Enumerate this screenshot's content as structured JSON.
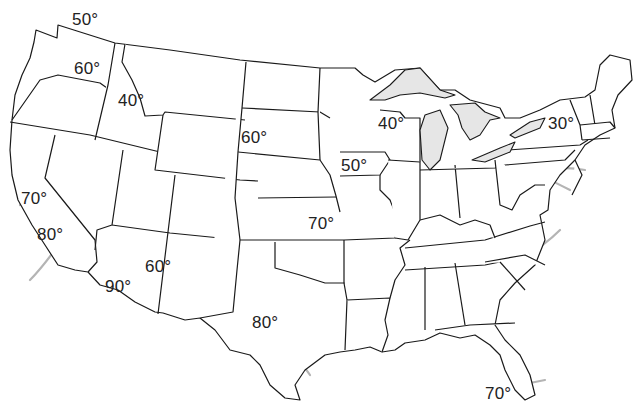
{
  "map": {
    "title": "",
    "subject": "United States isotherm map",
    "style": {
      "state_border_color": "#1a1a1a",
      "isotherm_color": "#b4b4b4",
      "lake_fill": "#e6e6e6",
      "background": "#ffffff",
      "label_color": "#222222"
    },
    "labels": [
      {
        "id": "wa-north",
        "text": "50°",
        "x": 72,
        "y": 11
      },
      {
        "id": "washington",
        "text": "60°",
        "x": 74,
        "y": 60
      },
      {
        "id": "idaho",
        "text": "40°",
        "x": 118,
        "y": 92
      },
      {
        "id": "south-dakota",
        "text": "60°",
        "x": 241,
        "y": 129
      },
      {
        "id": "wisconsin",
        "text": "40°",
        "x": 378,
        "y": 115
      },
      {
        "id": "new-york",
        "text": "30°",
        "x": 548,
        "y": 115
      },
      {
        "id": "iowa",
        "text": "50°",
        "x": 341,
        "y": 157
      },
      {
        "id": "california-north",
        "text": "70°",
        "x": 21,
        "y": 190
      },
      {
        "id": "kansas",
        "text": "70°",
        "x": 308,
        "y": 215
      },
      {
        "id": "california-south",
        "text": "80°",
        "x": 37,
        "y": 226
      },
      {
        "id": "arizona-east",
        "text": "60°",
        "x": 145,
        "y": 258
      },
      {
        "id": "arizona",
        "text": "90°",
        "x": 105,
        "y": 278
      },
      {
        "id": "texas",
        "text": "80°",
        "x": 252,
        "y": 314
      },
      {
        "id": "florida",
        "text": "70°",
        "x": 485,
        "y": 385
      }
    ]
  }
}
